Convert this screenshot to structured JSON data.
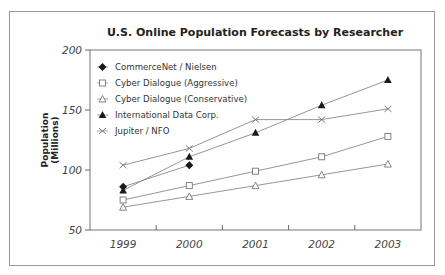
{
  "chart_data": {
    "type": "line",
    "title": "U.S. Online Population Forecasts by Researcher",
    "xlabel": "",
    "ylabel": "Population (Millions)",
    "ylabel_lines": [
      "Population",
      "(Millions)"
    ],
    "categories": [
      "1999",
      "2000",
      "2001",
      "2002",
      "2003"
    ],
    "ylim": [
      50,
      200
    ],
    "yticks": [
      50,
      100,
      150,
      200
    ],
    "grid": false,
    "legend_position": "upper-left inside plot",
    "series": [
      {
        "name": "CommerceNet / Nielsen",
        "marker": "filled-diamond",
        "values": [
          86,
          104,
          null,
          null,
          null
        ]
      },
      {
        "name": "Cyber Dialogue (Aggressive)",
        "marker": "open-square",
        "values": [
          75,
          87,
          99,
          111,
          128
        ]
      },
      {
        "name": "Cyber Dialogue (Conservative)",
        "marker": "open-triangle",
        "values": [
          69,
          78,
          87,
          96,
          105
        ]
      },
      {
        "name": "International Data Corp.",
        "marker": "filled-triangle",
        "values": [
          83,
          111,
          131,
          154,
          175
        ]
      },
      {
        "name": "Jupiter / NFO",
        "marker": "x",
        "values": [
          104,
          118,
          142,
          142,
          151
        ]
      }
    ]
  },
  "colors": {
    "line": "#8a8a8a",
    "marker_filled": "#1a1a1a",
    "marker_open": "#777777",
    "axis": "#666666",
    "frame": "#999999"
  }
}
